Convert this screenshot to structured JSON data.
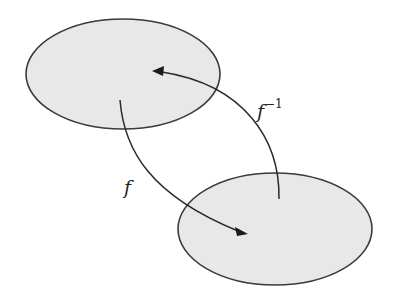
{
  "diagram": {
    "type": "function-and-inverse-mapping",
    "sets": [
      {
        "id": "domain",
        "shape": "ellipse",
        "cx": 123,
        "cy": 74,
        "rx": 97,
        "ry": 55,
        "fill": "#e8e8e8",
        "stroke": "#3a3a3a"
      },
      {
        "id": "codomain",
        "shape": "ellipse",
        "cx": 275,
        "cy": 229,
        "rx": 97,
        "ry": 56,
        "fill": "#e8e8e8",
        "stroke": "#3a3a3a"
      }
    ],
    "arrows": [
      {
        "id": "f",
        "from": "domain",
        "to": "codomain",
        "path": "M120,100 C124,150 150,190 245,222"
      },
      {
        "id": "f_inverse",
        "from": "codomain",
        "to": "domain",
        "path": "M279,199 C280,140 240,85 160,71"
      }
    ],
    "labels": {
      "f": "f",
      "f_inverse_base": "f",
      "f_inverse_exponent": "−1"
    }
  }
}
